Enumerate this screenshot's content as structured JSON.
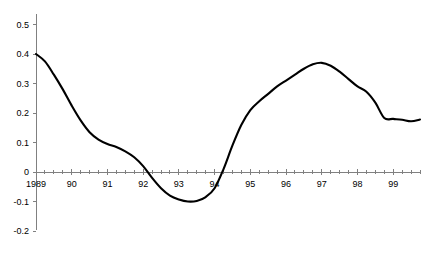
{
  "chart_data": {
    "type": "line",
    "title": "",
    "subtitle": "",
    "xlabel": "",
    "ylabel": "",
    "grid": false,
    "legend": "none",
    "line_color": "#000000",
    "axis_color": "#808080",
    "background_color": "#ffffff",
    "xlim": [
      1989.0,
      1999.75
    ],
    "ylim": [
      -0.2,
      0.5
    ],
    "y_ticks": [
      0.5,
      0.4,
      0.3,
      0.2,
      0.1,
      0,
      -0.1,
      -0.2
    ],
    "y_tick_labels": [
      "0.5",
      "0.4",
      "0.3",
      "0.2",
      "0.1",
      "0",
      "-0.1",
      "-0.2"
    ],
    "x_ticks": [
      1989,
      1990,
      1991,
      1992,
      1993,
      1994,
      1995,
      1996,
      1997,
      1998,
      1999
    ],
    "x_tick_labels": [
      "1989",
      "90",
      "91",
      "92",
      "93",
      "94",
      "95",
      "96",
      "97",
      "98",
      "99"
    ],
    "x_minor_tick_interval": 0.25,
    "series": [
      {
        "name": "series-1",
        "x": [
          1989.0,
          1989.25,
          1989.5,
          1989.75,
          1990.0,
          1990.25,
          1990.5,
          1990.75,
          1991.0,
          1991.25,
          1991.5,
          1991.75,
          1992.0,
          1992.25,
          1992.5,
          1992.75,
          1993.0,
          1993.25,
          1993.5,
          1993.75,
          1994.0,
          1994.25,
          1994.5,
          1994.75,
          1995.0,
          1995.25,
          1995.5,
          1995.75,
          1996.0,
          1996.25,
          1996.5,
          1996.75,
          1997.0,
          1997.25,
          1997.5,
          1997.75,
          1998.0,
          1998.25,
          1998.5,
          1998.75,
          1999.0,
          1999.25,
          1999.5,
          1999.75
        ],
        "values": [
          0.4,
          0.375,
          0.33,
          0.28,
          0.225,
          0.175,
          0.135,
          0.11,
          0.095,
          0.085,
          0.07,
          0.05,
          0.02,
          -0.02,
          -0.055,
          -0.08,
          -0.093,
          -0.1,
          -0.098,
          -0.085,
          -0.055,
          0.01,
          0.09,
          0.16,
          0.21,
          0.24,
          0.265,
          0.29,
          0.31,
          0.33,
          0.35,
          0.365,
          0.37,
          0.36,
          0.34,
          0.315,
          0.29,
          0.272,
          0.235,
          0.183,
          0.18,
          0.177,
          0.172,
          0.178
        ]
      }
    ],
    "annotations": []
  },
  "layout": {
    "plot_left_px": 36,
    "plot_right_px": 420,
    "zero_line_y_px": 172,
    "value_scale_px_per_unit": 295
  }
}
